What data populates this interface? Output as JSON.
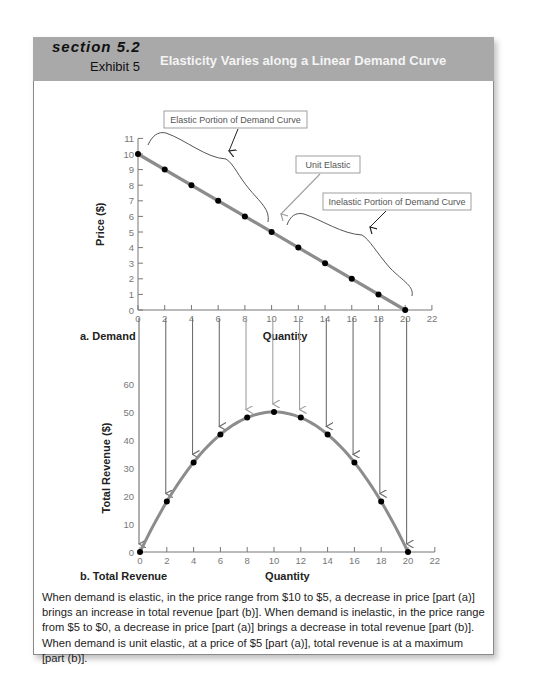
{
  "header": {
    "section": "section 5.2",
    "exhibit": "Exhibit 5",
    "title": "Elasticity Varies along a Linear Demand Curve"
  },
  "colors": {
    "header_bg": "#a9a9a9",
    "curve": "#8c8c8c",
    "point": "#000000",
    "axis": "#777777",
    "arrow_dark": "#6e6e6e",
    "arrow_light": "#a0a0a0"
  },
  "annotations": {
    "elastic": "Elastic Portion of Demand Curve",
    "unit": "Unit Elastic",
    "inelastic": "Inelastic Portion of Demand Curve"
  },
  "caption": "When demand is elastic, in the price range from $10 to $5, a decrease in price [part (a)] brings an increase in total revenue [part (b)]. When demand is inelastic, in the price range from $5 to $0, a decrease in price [part (a)] brings a decrease in total revenue [part (b)]. When demand is unit elastic, at a price of $5 [part (a)], total revenue is at a maximum [part (b)].",
  "chart_data": [
    {
      "type": "line",
      "title": "a. Demand",
      "xlabel": "Quantity",
      "ylabel": "Price ($)",
      "xlim": [
        0,
        22
      ],
      "ylim": [
        0,
        11
      ],
      "xticks": [
        0,
        2,
        4,
        6,
        8,
        10,
        12,
        14,
        16,
        18,
        20,
        22
      ],
      "yticks": [
        0,
        1,
        2,
        3,
        4,
        5,
        6,
        7,
        8,
        9,
        10,
        11
      ],
      "grid": false,
      "x": [
        0,
        2,
        4,
        6,
        8,
        10,
        12,
        14,
        16,
        18,
        20
      ],
      "series": [
        {
          "name": "Demand",
          "values": [
            10,
            9,
            8,
            7,
            6,
            5,
            4,
            3,
            2,
            1,
            0
          ]
        }
      ],
      "annotations": [
        "Elastic Portion of Demand Curve",
        "Unit Elastic",
        "Inelastic Portion of Demand Curve"
      ]
    },
    {
      "type": "line",
      "title": "b. Total Revenue",
      "xlabel": "Quantity",
      "ylabel": "Total Revenue ($)",
      "xlim": [
        0,
        22
      ],
      "ylim": [
        0,
        60
      ],
      "xticks": [
        0,
        2,
        4,
        6,
        8,
        10,
        12,
        14,
        16,
        18,
        20,
        22
      ],
      "yticks": [
        0,
        10,
        20,
        30,
        40,
        50,
        60
      ],
      "grid": false,
      "x": [
        0,
        2,
        4,
        6,
        8,
        10,
        12,
        14,
        16,
        18,
        20
      ],
      "series": [
        {
          "name": "Total Revenue",
          "values": [
            0,
            18,
            32,
            42,
            48,
            50,
            48,
            42,
            32,
            18,
            0
          ]
        }
      ]
    }
  ]
}
